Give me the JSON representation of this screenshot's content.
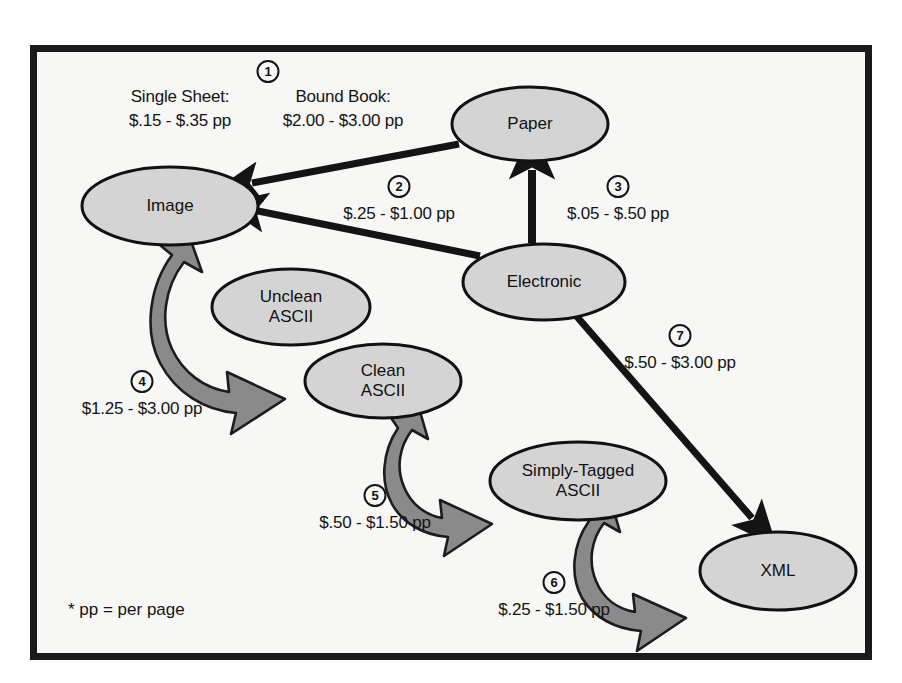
{
  "diagram": {
    "footnote": "* pp = per page",
    "colors": {
      "node_fill": "#d4d4d4",
      "node_stroke": "#111111",
      "arrow_black": "#141414",
      "arrow_gray": "#8a8a8a",
      "frame": "#1a1a1a",
      "background": "#f7f7f5"
    },
    "nodes": [
      {
        "id": "paper",
        "label": "Paper",
        "cx": 530,
        "cy": 124,
        "rx": 78,
        "ry": 37
      },
      {
        "id": "image",
        "label": "Image",
        "cx": 170,
        "cy": 206,
        "rx": 88,
        "ry": 39
      },
      {
        "id": "electronic",
        "label": "Electronic",
        "cx": 544,
        "cy": 282,
        "rx": 81,
        "ry": 38
      },
      {
        "id": "unclean_ascii",
        "label": "Unclean\nASCII",
        "cx": 291,
        "cy": 307,
        "rx": 79,
        "ry": 38
      },
      {
        "id": "clean_ascii",
        "label": "Clean\nASCII",
        "cx": 383,
        "cy": 381,
        "rx": 78,
        "ry": 37
      },
      {
        "id": "simply_tagged_ascii",
        "label": "Simply-Tagged\nASCII",
        "cx": 578,
        "cy": 481,
        "rx": 88,
        "ry": 39
      },
      {
        "id": "xml",
        "label": "XML",
        "cx": 778,
        "cy": 571,
        "rx": 78,
        "ry": 39
      }
    ],
    "edges": [
      {
        "number": "1",
        "from": "paper",
        "to": "image",
        "style": "black-straight"
      },
      {
        "number": "2",
        "from": "electronic",
        "to": "image",
        "style": "black-straight"
      },
      {
        "number": "3",
        "from": "electronic",
        "to": "paper",
        "style": "black-straight"
      },
      {
        "number": "4",
        "from": "clean_ascii",
        "to": "image",
        "style": "gray-curved"
      },
      {
        "number": "5",
        "from": "clean_ascii",
        "to": "simply_tagged_ascii",
        "style": "gray-curved"
      },
      {
        "number": "6",
        "from": "simply_tagged_ascii",
        "to": "xml",
        "style": "gray-curved"
      },
      {
        "number": "7",
        "from": "electronic",
        "to": "xml",
        "style": "black-straight"
      }
    ],
    "annotations": [
      {
        "id": "cost-1",
        "number": "1",
        "number_x": 268,
        "number_y": 60,
        "lines": [
          {
            "text": "Single Sheet:",
            "x": 180,
            "y": 86
          },
          {
            "text": "$.15 - $.35 pp",
            "x": 180,
            "y": 110
          },
          {
            "text": "Bound Book:",
            "x": 343,
            "y": 86
          },
          {
            "text": "$2.00 - $3.00 pp",
            "x": 343,
            "y": 110
          }
        ]
      },
      {
        "id": "cost-2",
        "number": "2",
        "number_x": 399,
        "number_y": 175,
        "lines": [
          {
            "text": "$.25 - $1.00 pp",
            "x": 399,
            "y": 203
          }
        ]
      },
      {
        "id": "cost-3",
        "number": "3",
        "number_x": 618,
        "number_y": 175,
        "lines": [
          {
            "text": "$.05 - $.50 pp",
            "x": 618,
            "y": 203
          }
        ]
      },
      {
        "id": "cost-4",
        "number": "4",
        "number_x": 142,
        "number_y": 370,
        "lines": [
          {
            "text": "$1.25 - $3.00 pp",
            "x": 142,
            "y": 398
          }
        ]
      },
      {
        "id": "cost-5",
        "number": "5",
        "number_x": 375,
        "number_y": 484,
        "lines": [
          {
            "text": "$.50 - $1.50 pp",
            "x": 375,
            "y": 512
          }
        ]
      },
      {
        "id": "cost-6",
        "number": "6",
        "number_x": 554,
        "number_y": 571,
        "lines": [
          {
            "text": "$.25 - $1.50 pp",
            "x": 554,
            "y": 599
          }
        ]
      },
      {
        "id": "cost-7",
        "number": "7",
        "number_x": 680,
        "number_y": 324,
        "lines": [
          {
            "text": "$.50 - $3.00 pp",
            "x": 680,
            "y": 352
          }
        ]
      }
    ],
    "footnote_pos": {
      "x": 68,
      "y": 600
    }
  }
}
